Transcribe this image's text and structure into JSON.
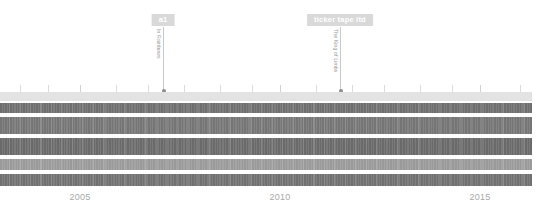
{
  "chart_data": {
    "type": "area",
    "title": "",
    "xlabel": "",
    "ylabel": "",
    "xlim": [
      2003.0,
      2016.3
    ],
    "grid": false,
    "legend_position": "none",
    "x_tick_labels": [
      "2005",
      "2010",
      "2015"
    ],
    "x_tick_values": [
      2005,
      2010,
      2015
    ],
    "minor_tick_values": [
      2003.5,
      2004.2,
      2005,
      2005.9,
      2006.7,
      2007.6,
      2008.5,
      2009.3,
      2010,
      2010.9,
      2011.8,
      2012.6,
      2013.5,
      2014.3,
      2015,
      2016.0
    ],
    "series": [
      {
        "name": "band-1",
        "color": "#e3e3e3",
        "top": 0,
        "height": 9,
        "texture": "none"
      },
      {
        "name": "band-2",
        "color": "#6e6e6e",
        "top": 11,
        "height": 10,
        "texture": "stripes"
      },
      {
        "name": "band-3",
        "color": "#757575",
        "top": 25,
        "height": 17,
        "texture": "stripes"
      },
      {
        "name": "band-4",
        "color": "#6a6a6a",
        "top": 46,
        "height": 17,
        "texture": "stripes"
      },
      {
        "name": "band-5",
        "color": "#9a9a9a",
        "top": 67,
        "height": 11,
        "texture": "stripes"
      },
      {
        "name": "band-6",
        "color": "#707070",
        "top": 82,
        "height": 12,
        "texture": "stripes"
      }
    ],
    "annotations": [
      {
        "badge": "a1",
        "caption": "In Rainbows",
        "x_value": 2007.0,
        "x_px": 163,
        "line_height": 64
      },
      {
        "badge": "ticker tape ltd",
        "caption": "The King of Limbs",
        "x_value": 2011.2,
        "x_px": 340,
        "line_height": 64
      }
    ]
  },
  "colors": {
    "badge_background": "#d9d9d9",
    "badge_text": "#ffffff",
    "caption_text": "#9a9a9a",
    "axis_label_text": "#a8a8a8",
    "leader_line": "#c9c9c9",
    "marker_dot": "#8d8d8d",
    "tick": "#dcdcdc",
    "page_background": "#ffffff"
  }
}
